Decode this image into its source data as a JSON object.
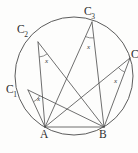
{
  "figure": {
    "shape": "circle",
    "stroke_color": "#4a4a4a",
    "label_color": "#2e2e2e",
    "background_color": "#fdfdfc",
    "angle_symbol": "x"
  },
  "geometry": {
    "circle": {
      "center_x": 74,
      "center_y": 76,
      "radius": 59
    },
    "points": [
      {
        "id": "A",
        "label": "A",
        "sub": "",
        "x": 45,
        "y": 127
      },
      {
        "id": "B",
        "label": "B",
        "sub": "",
        "x": 104,
        "y": 127
      },
      {
        "id": "C1",
        "label": "C",
        "sub": "1",
        "x": 28,
        "y": 90
      },
      {
        "id": "C2",
        "label": "C",
        "sub": "2",
        "x": 38,
        "y": 42
      },
      {
        "id": "C3",
        "label": "C",
        "sub": "3",
        "x": 92,
        "y": 22
      },
      {
        "id": "C4",
        "label": "C",
        "sub": "4",
        "x": 130,
        "y": 58
      }
    ],
    "chords": [
      {
        "from": "A",
        "to": "B"
      },
      {
        "from": "C1",
        "to": "A"
      },
      {
        "from": "C1",
        "to": "B"
      },
      {
        "from": "C2",
        "to": "A"
      },
      {
        "from": "C2",
        "to": "B"
      },
      {
        "from": "C3",
        "to": "A"
      },
      {
        "from": "C3",
        "to": "B"
      },
      {
        "from": "C4",
        "to": "A"
      },
      {
        "from": "C4",
        "to": "B"
      }
    ],
    "angle_marks": [
      {
        "at": "C1",
        "value": "x",
        "label_x": 37,
        "label_y": 96
      },
      {
        "at": "C2",
        "value": "x",
        "label_x": 45,
        "label_y": 58
      },
      {
        "at": "C3",
        "value": "x",
        "label_x": 87,
        "label_y": 44
      },
      {
        "at": "C4",
        "value": "x",
        "label_x": 114,
        "label_y": 78
      }
    ]
  },
  "labels": {
    "point_a": "A",
    "point_b": "B",
    "point_c1": "C",
    "point_c1_sub": "1",
    "point_c2": "C",
    "point_c2_sub": "2",
    "point_c3": "C",
    "point_c3_sub": "3",
    "point_c4": "C",
    "point_c4_sub": "4",
    "angle_c1": "x",
    "angle_c2": "x",
    "angle_c3": "x",
    "angle_c4": "x"
  },
  "label_positions": {
    "a": {
      "left": 40,
      "top": 129
    },
    "b": {
      "left": 99,
      "top": 129
    },
    "c1": {
      "left": 6,
      "top": 84
    },
    "c2": {
      "left": 17,
      "top": 24
    },
    "c3": {
      "left": 84,
      "top": 6
    },
    "c4": {
      "left": 131,
      "top": 49
    }
  }
}
